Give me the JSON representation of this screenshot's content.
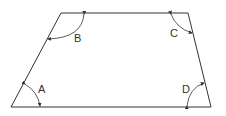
{
  "diagram": {
    "type": "trapezoid",
    "angles": [
      {
        "label": "A"
      },
      {
        "label": "B"
      },
      {
        "label": "C"
      },
      {
        "label": "D"
      }
    ],
    "colors": {
      "stroke": "#333333",
      "background": "#ffffff"
    }
  }
}
